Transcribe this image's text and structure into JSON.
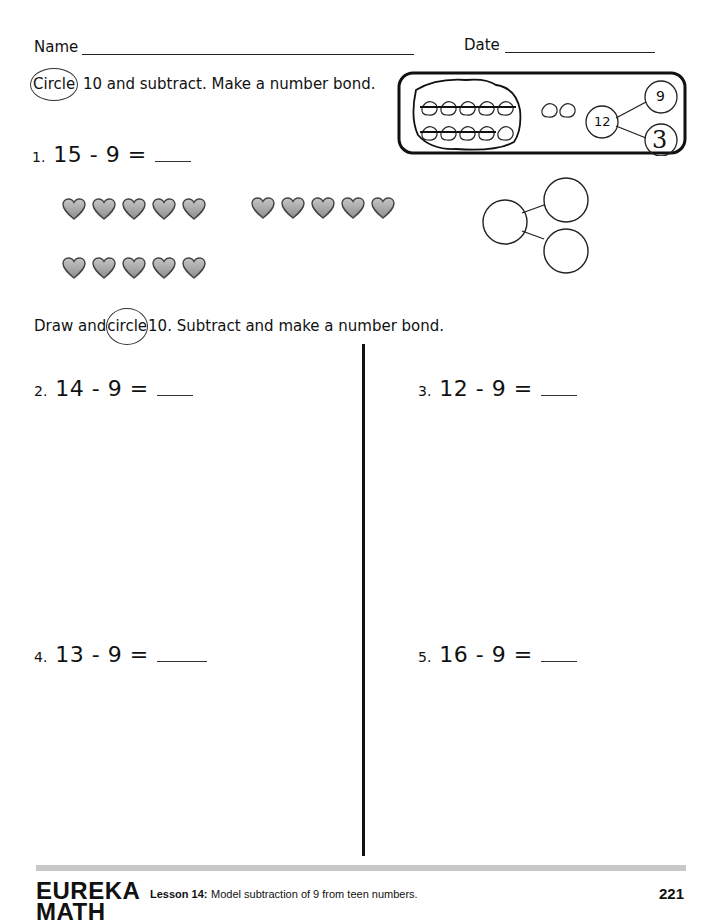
{
  "header": {
    "name_label": "Name",
    "date_label": "Date"
  },
  "section1": {
    "instruction_circled_word": "Circle",
    "instruction_rest": "10 and subtract. Make a number bond.",
    "example": {
      "objects_in_ten_group": 10,
      "objects_outside": 2,
      "bond_whole": "12",
      "bond_part_top": "9",
      "bond_part_bottom": "3"
    },
    "problem": {
      "number": "1.",
      "equation": "15 - 9 =",
      "answer": ""
    },
    "hearts": {
      "row1_group1": 5,
      "row1_group2": 5,
      "row2_group1": 5,
      "total": 15
    },
    "number_bond": {
      "whole": "",
      "part_top": "",
      "part_bottom": ""
    }
  },
  "section2": {
    "instruction_prefix": "Draw and",
    "instruction_circled_word": "circle",
    "instruction_rest": "10.  Subtract and make a number bond.",
    "problems": [
      {
        "number": "2.",
        "equation": "14 - 9 =",
        "answer": ""
      },
      {
        "number": "3.",
        "equation": "12 - 9 =",
        "answer": ""
      },
      {
        "number": "4.",
        "equation": "13 - 9 =",
        "answer": ""
      },
      {
        "number": "5.",
        "equation": "16 - 9 =",
        "answer": ""
      }
    ]
  },
  "footer": {
    "brand_line1": "EUREKA",
    "brand_line2": "MATH",
    "lesson_label": "Lesson 14:",
    "lesson_title": "Model subtraction of 9 from teen numbers.",
    "page_number": "221"
  },
  "colors": {
    "heart_fill": "#a9a9a9",
    "heart_stroke": "#444444",
    "footer_bar": "#c8c8c8"
  }
}
